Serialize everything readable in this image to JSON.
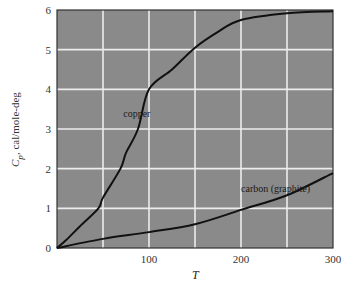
{
  "chart_data": {
    "type": "line",
    "title": "",
    "xlabel": "T",
    "ylabel": "C_p, cal/mole-deg",
    "xlim": [
      0,
      300
    ],
    "ylim": [
      0,
      6
    ],
    "x_ticks": [
      0,
      100,
      200,
      300
    ],
    "x_tick_labels": [
      "",
      "100",
      "200",
      "300"
    ],
    "y_ticks": [
      0,
      1,
      2,
      3,
      4,
      5,
      6
    ],
    "y_tick_labels": [
      "0",
      "1",
      "2",
      "3",
      "4",
      "5",
      "6"
    ],
    "grid": true,
    "grid_x_step": 50,
    "grid_y_step": 1,
    "legend": "none (curves labeled inline)",
    "series": [
      {
        "name": "copper",
        "x": [
          0,
          10,
          25,
          45,
          50,
          69,
          75,
          88,
          100,
          125,
          150,
          175,
          200,
          250,
          300
        ],
        "y": [
          0,
          0.2,
          0.55,
          1.0,
          1.27,
          2.0,
          2.4,
          3.0,
          4.0,
          4.5,
          5.05,
          5.45,
          5.75,
          5.92,
          5.97
        ]
      },
      {
        "name": "carbon (graphite)",
        "x": [
          0,
          50,
          100,
          150,
          200,
          250,
          300
        ],
        "y": [
          0,
          0.23,
          0.4,
          0.6,
          0.96,
          1.33,
          1.89
        ]
      }
    ],
    "annotations": [
      {
        "text": "copper",
        "x": 72,
        "y": 3.3
      },
      {
        "text": "carbon (graphite)",
        "x": 200,
        "y": 1.4
      }
    ]
  },
  "labels": {
    "x_axis": "T",
    "y_axis_symbol": "C",
    "y_axis_subscript": "p",
    "y_axis_units": ", cal/mole-deg"
  },
  "colors": {
    "plot_background": "#8a8a8a",
    "grid": "#ececec",
    "curve": "#111111",
    "frame": "#333333"
  }
}
